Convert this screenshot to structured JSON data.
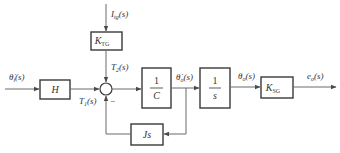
{
  "diagram": {
    "type": "control-block-diagram",
    "colors": {
      "line": "#6b6b6b",
      "box": "#3a3a3a",
      "text": "#333333",
      "background": "#ffffff"
    },
    "signals": {
      "input": {
        "main": "θ̇",
        "sub": "i",
        "arg": "(s)"
      },
      "disturbance": {
        "main": "I",
        "sub": "tg",
        "arg": "(s)"
      },
      "t1": {
        "main": "T",
        "sub": "1",
        "arg": "(s)"
      },
      "t2": {
        "main": "T",
        "sub": "2",
        "arg": "(s)"
      },
      "omega_out": {
        "main": "θ̇",
        "sub": "o",
        "arg": "(s)"
      },
      "theta_out": {
        "main": "θ",
        "sub": "o",
        "arg": "(s)"
      },
      "output": {
        "main": "e",
        "sub": "o",
        "arg": "(s)"
      }
    },
    "blocks": {
      "h": {
        "label": "H"
      },
      "ktg": {
        "main": "K",
        "sub": "TG"
      },
      "inv_c": {
        "num": "1",
        "den": "C"
      },
      "integrator": {
        "num": "1",
        "den": "s"
      },
      "ksg": {
        "main": "K",
        "sub": "SG"
      },
      "js": {
        "label": "Js"
      }
    },
    "summing_junction": {
      "feedback_sign": "−"
    }
  }
}
